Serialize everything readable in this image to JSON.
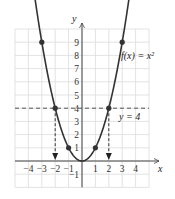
{
  "chart_data": {
    "type": "line",
    "title": "",
    "function_label": "f(x) = x²",
    "line_label": "y = 4",
    "xlabel": "x",
    "ylabel": "y",
    "xlim": [
      -5,
      5
    ],
    "ylim": [
      -2,
      10
    ],
    "x_ticks": [
      "-4",
      "-3",
      "-2",
      "-1",
      "1",
      "2",
      "3",
      "4"
    ],
    "y_ticks": [
      "-1",
      "1",
      "2",
      "3",
      "4",
      "5",
      "6",
      "7",
      "8",
      "9"
    ],
    "grid": true,
    "series": [
      {
        "name": "f(x) = x^2",
        "x": [
          -3,
          -2,
          -1,
          0,
          1,
          2,
          3
        ],
        "y": [
          9,
          4,
          1,
          0,
          1,
          4,
          9
        ],
        "marked_points": [
          [
            -3,
            9
          ],
          [
            -2,
            4
          ],
          [
            -1,
            1
          ],
          [
            1,
            1
          ],
          [
            2,
            4
          ],
          [
            3,
            9
          ]
        ]
      },
      {
        "name": "y = 4",
        "style": "dashed",
        "y": 4
      }
    ],
    "annotations": [
      {
        "type": "dashed-arrow",
        "from": [
          -2,
          4
        ],
        "to": [
          -2,
          0
        ]
      },
      {
        "type": "dashed-arrow",
        "from": [
          2,
          4
        ],
        "to": [
          2,
          0
        ]
      }
    ]
  }
}
